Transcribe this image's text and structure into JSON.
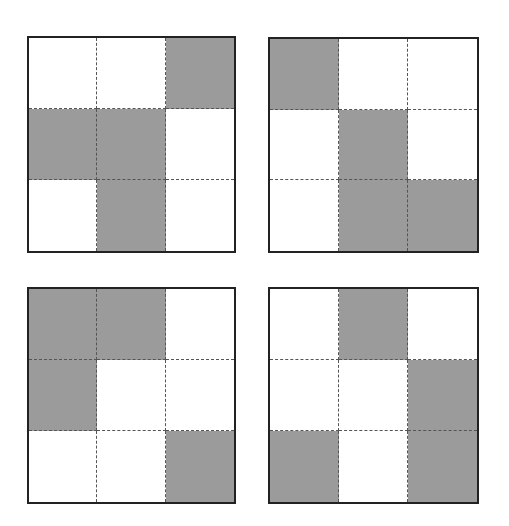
{
  "colors": {
    "filled": "#9b9b9b",
    "empty": "#ffffff",
    "border": "#222222",
    "divider": "#555555"
  },
  "grids": [
    {
      "id": "top-left",
      "position": {
        "left": 27,
        "top": 36,
        "width": 209,
        "height": 217
      },
      "cells": [
        [
          0,
          0,
          1
        ],
        [
          1,
          1,
          0
        ],
        [
          0,
          1,
          0
        ]
      ]
    },
    {
      "id": "top-right",
      "position": {
        "left": 268,
        "top": 37,
        "width": 211,
        "height": 216
      },
      "cells": [
        [
          1,
          0,
          0
        ],
        [
          0,
          1,
          0
        ],
        [
          0,
          1,
          1
        ]
      ]
    },
    {
      "id": "bottom-left",
      "position": {
        "left": 27,
        "top": 287,
        "width": 209,
        "height": 217
      },
      "cells": [
        [
          1,
          1,
          0
        ],
        [
          1,
          0,
          0
        ],
        [
          0,
          0,
          1
        ]
      ]
    },
    {
      "id": "bottom-right",
      "position": {
        "left": 268,
        "top": 287,
        "width": 211,
        "height": 217
      },
      "cells": [
        [
          0,
          1,
          0
        ],
        [
          0,
          0,
          1
        ],
        [
          1,
          0,
          1
        ]
      ]
    }
  ]
}
